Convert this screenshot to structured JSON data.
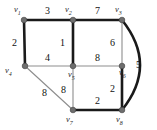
{
  "figure": {
    "type": "weighted-undirected-graph",
    "background_color": "#ffffff",
    "node_color": "#6e6e6e",
    "thick_edge_color": "#1a1a1a",
    "thin_edge_color": "#8d8d8d"
  },
  "nodes": [
    {
      "id": "v1",
      "label": "v",
      "sub": "1",
      "x": 24,
      "y": 20,
      "label_x": 14,
      "label_y": 5
    },
    {
      "id": "v2",
      "label": "v",
      "sub": "2",
      "x": 73,
      "y": 20,
      "label_x": 65,
      "label_y": 5
    },
    {
      "id": "v3",
      "label": "v",
      "sub": "3",
      "x": 122,
      "y": 20,
      "label_x": 115,
      "label_y": 5
    },
    {
      "id": "v4",
      "label": "v",
      "sub": "4",
      "x": 25,
      "y": 66,
      "label_x": 5,
      "label_y": 66
    },
    {
      "id": "v5",
      "label": "v",
      "sub": "5",
      "x": 73,
      "y": 66,
      "label_x": 68,
      "label_y": 70
    },
    {
      "id": "v6",
      "label": "v",
      "sub": "6",
      "x": 122,
      "y": 66,
      "label_x": 119,
      "label_y": 68
    },
    {
      "id": "v7",
      "label": "v",
      "sub": "7",
      "x": 73,
      "y": 110,
      "label_x": 66,
      "label_y": 115
    },
    {
      "id": "v8",
      "label": "v",
      "sub": "8",
      "x": 122,
      "y": 110,
      "label_x": 116,
      "label_y": 115
    }
  ],
  "edges": [
    {
      "id": "e-v1-v2",
      "from": "v1",
      "to": "v2",
      "weight": "3",
      "style": "thick",
      "curved": false,
      "label_x": 45,
      "label_y": 6
    },
    {
      "id": "e-v2-v3",
      "from": "v2",
      "to": "v3",
      "weight": "7",
      "style": "thick",
      "curved": false,
      "label_x": 95,
      "label_y": 6
    },
    {
      "id": "e-v1-v4",
      "from": "v1",
      "to": "v4",
      "weight": "2",
      "style": "thick",
      "curved": false,
      "label_x": 12,
      "label_y": 38
    },
    {
      "id": "e-v2-v5",
      "from": "v2",
      "to": "v5",
      "weight": "1",
      "style": "thick",
      "curved": false,
      "label_x": 60,
      "label_y": 38
    },
    {
      "id": "e-v3-v6",
      "from": "v3",
      "to": "v6",
      "weight": "6",
      "style": "thin",
      "curved": false,
      "label_x": 110,
      "label_y": 38
    },
    {
      "id": "e-v4-v5",
      "from": "v4",
      "to": "v5",
      "weight": "4",
      "style": "thin",
      "curved": false,
      "label_x": 45,
      "label_y": 53
    },
    {
      "id": "e-v5-v6",
      "from": "v5",
      "to": "v6",
      "weight": "8",
      "style": "thin",
      "curved": false,
      "label_x": 95,
      "label_y": 53
    },
    {
      "id": "e-v4-v7",
      "from": "v4",
      "to": "v7",
      "weight": "8",
      "style": "thin",
      "curved": false,
      "label_x": 42,
      "label_y": 88
    },
    {
      "id": "e-v5-v7",
      "from": "v5",
      "to": "v7",
      "weight": "8",
      "style": "thin",
      "curved": false,
      "label_x": 61,
      "label_y": 85
    },
    {
      "id": "e-v6-v8",
      "from": "v6",
      "to": "v8",
      "weight": "2",
      "style": "thick",
      "curved": false,
      "label_x": 110,
      "label_y": 84
    },
    {
      "id": "e-v7-v8",
      "from": "v7",
      "to": "v8",
      "weight": "2",
      "style": "thick",
      "curved": false,
      "label_x": 95,
      "label_y": 96
    },
    {
      "id": "e-v3-v8",
      "from": "v3",
      "to": "v8",
      "weight": "5",
      "style": "thick",
      "curved": true,
      "curve_ctrl_x": 158,
      "curve_ctrl_y": 65,
      "label_x": 136,
      "label_y": 60
    }
  ]
}
